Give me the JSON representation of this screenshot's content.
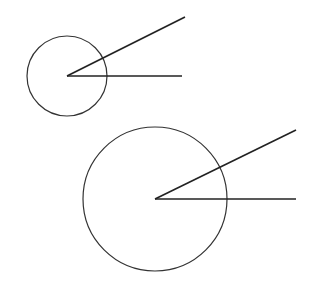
{
  "diagram": {
    "stroke_color": "#222222",
    "background": "#ffffff",
    "figures": [
      {
        "name": "small",
        "circle": {
          "cx": 67,
          "cy": 76,
          "r": 40
        },
        "rays": [
          {
            "x1": 67,
            "y1": 76,
            "x2": 185,
            "y2": 17
          },
          {
            "x1": 67,
            "y1": 76,
            "x2": 182,
            "y2": 76
          }
        ]
      },
      {
        "name": "large",
        "circle": {
          "cx": 155,
          "cy": 199,
          "r": 72
        },
        "rays": [
          {
            "x1": 155,
            "y1": 199,
            "x2": 296,
            "y2": 130
          },
          {
            "x1": 155,
            "y1": 199,
            "x2": 296,
            "y2": 199
          }
        ]
      }
    ]
  }
}
